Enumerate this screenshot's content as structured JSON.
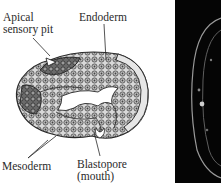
{
  "figure": {
    "panel_left": {
      "type": "line-drawing",
      "subject": "embryo cross-section",
      "labels": [
        {
          "id": "apical",
          "lines": [
            "Apical",
            "sensory pit"
          ]
        },
        {
          "id": "endoderm",
          "lines": [
            "Endoderm"
          ]
        },
        {
          "id": "mesoderm",
          "lines": [
            "Mesoderm"
          ]
        },
        {
          "id": "blastopore",
          "lines": [
            "Blastopore",
            "(mouth)"
          ]
        }
      ]
    },
    "panel_right": {
      "type": "micrograph",
      "background": "#050505"
    }
  },
  "colors": {
    "ink": "#2a2a2a",
    "cell_fill": "#cfcfcf",
    "cell_dark": "#5a5a5a",
    "background": "#ffffff"
  }
}
